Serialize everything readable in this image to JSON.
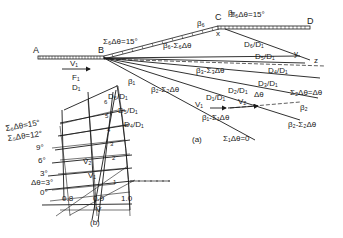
{
  "figure": {
    "part_a": {
      "caption": "(a)",
      "points": {
        "A": "A",
        "B": "B",
        "C": "C",
        "D": "D",
        "x": "x",
        "y": "y",
        "z": "z"
      },
      "inflow": {
        "velocity": "V₁",
        "flow": "F₁",
        "depth": "D₁"
      },
      "wall_angle_label": "Σ₆Δθ=15°",
      "wall_angle_label_2": "Σ₆Δθ=15°",
      "angles": {
        "beta1": "β₁",
        "beta2_minus": "β₂-Σ₂Δθ",
        "beta3_minus": "β₃-Σ₃Δθ",
        "beta6": "β₆",
        "beta6_minus": "β₆-Σ₆Δθ",
        "betax": "βₓ",
        "beta1_minus": "β₁-Σ₁Δθ",
        "beta2": "β₂",
        "beta2_minus_b": "β₂-Σ₂Δθ"
      },
      "depth_ratios": [
        "D₁/D₁",
        "D₂/D₁",
        "D₃/D₁",
        "D₄/D₁",
        "D₅/D₁",
        "D₆/D₁"
      ],
      "vectors": {
        "v1": "V₁",
        "v2": "V₂",
        "dtheta": "Δθ"
      },
      "sum2": "Σ₂Δθ=Δθ",
      "sum1": "Σ₁Δθ=0"
    },
    "part_b": {
      "caption": "(b)",
      "axis_label": "V̄",
      "x_ticks": [
        "0.8",
        "0.9",
        "1.0"
      ],
      "angle_labels": [
        "Σ₆Δθ=15°",
        "Σ₅Δθ=12°",
        "9°",
        "6°",
        "3°",
        "Δθ=3°",
        "0°"
      ],
      "depth_labels": [
        "D₆/D₁",
        "D₅/D₁",
        "D₄/D₁"
      ],
      "region_numbers": [
        "6",
        "5",
        "4",
        "3",
        "2",
        "1"
      ],
      "vectors": {
        "v1": "V̄₁",
        "v2": "V̄₂"
      }
    }
  }
}
